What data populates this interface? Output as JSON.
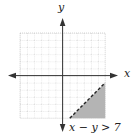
{
  "graph": {
    "x_axis_label": "x",
    "y_axis_label": "y",
    "inequality_label": "x − y > 7",
    "grid": {
      "xmin": -6,
      "xmax": 6,
      "ymin": -6,
      "ymax": 6,
      "step": 1
    },
    "boundary_line": {
      "equation": "x − y = 7",
      "style": "dashed"
    },
    "shaded_region": "below-right of line (x − y > 7)",
    "colors": {
      "shade": "#b4b4b4",
      "grid": "#bdbdbd",
      "axis": "#333333"
    }
  }
}
